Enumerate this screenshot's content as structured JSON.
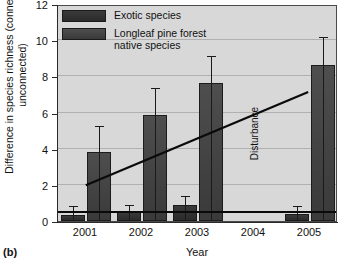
{
  "panel": {
    "label": "(b)"
  },
  "chart_data": {
    "type": "bar",
    "title": "",
    "xlabel": "Year",
    "ylabel": "Difference in species richness\n(connected-unconnected)",
    "categories": [
      "2001",
      "2002",
      "2003",
      "2004",
      "2005"
    ],
    "ylim": [
      0,
      12
    ],
    "yticks": [
      0,
      2,
      4,
      6,
      8,
      10,
      12
    ],
    "ytick_labels": [
      "0",
      "2",
      "4",
      "6",
      "8",
      "10",
      "12"
    ],
    "grid": true,
    "legend_position": "top-left",
    "series": [
      {
        "name": "Exotic species",
        "color": "#313131",
        "values": [
          0.35,
          0.5,
          0.9,
          null,
          0.4
        ],
        "errors_upper": [
          0.75,
          0.85,
          1.35,
          null,
          0.8
        ]
      },
      {
        "name": "Longleaf pine forest\nnative species",
        "color": "#464646",
        "values": [
          3.8,
          5.85,
          7.65,
          null,
          8.65
        ],
        "errors_upper": [
          5.2,
          7.3,
          9.05,
          null,
          10.1
        ]
      }
    ],
    "annotations": [
      {
        "name": "disturbance",
        "text": "Disturbance",
        "at_category": "2004",
        "rotation": -90
      },
      {
        "name": "trend-line",
        "type": "line",
        "x_start": "2001",
        "y_start": 2.0,
        "x_end": "2005",
        "y_end": 7.2
      },
      {
        "name": "baseline-reference-line",
        "type": "hline",
        "y": 0.5
      }
    ]
  }
}
